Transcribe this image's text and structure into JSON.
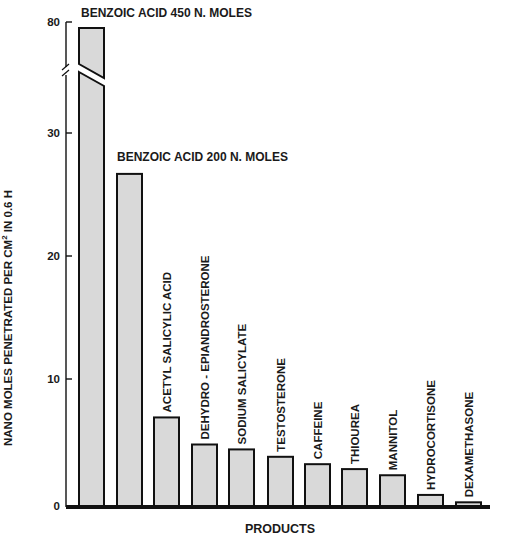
{
  "page_header": {
    "left": "",
    "right": ""
  },
  "chart_data": {
    "type": "bar",
    "title": "",
    "xlabel": "PRODUCTS",
    "ylabel": "NANO MOLES PENETRATED PER CM² IN 0.6 H",
    "ylabel_parts": {
      "before": "NANO MOLES PENETRATED PER CM",
      "sup": "2",
      "after": " IN 0.6 H"
    },
    "y_ticks": [
      0,
      10,
      20,
      30,
      80
    ],
    "y_break": {
      "from": 35,
      "to": 75
    },
    "ylim": [
      0,
      80
    ],
    "grid": false,
    "legend": null,
    "categories": [
      "BENZOIC ACID 450 N. MOLES",
      "BENZOIC ACID 200 N. MOLES",
      "ACETYL SALICYLIC ACID",
      "DEHYDRO - EPIANDROSTERONE",
      "SODIUM SALICYLATE",
      "TESTOSTERONE",
      "CAFFEINE",
      "THIOUREA",
      "MANNITOL",
      "HYDROCORTISONE",
      "DEXAMETHASONE"
    ],
    "values": [
      80,
      27,
      7.2,
      5.0,
      4.6,
      4.0,
      3.4,
      3.0,
      2.5,
      0.9,
      0.3
    ],
    "label_orientation": [
      "horizontal",
      "horizontal",
      "vertical",
      "vertical",
      "vertical",
      "vertical",
      "vertical",
      "vertical",
      "vertical",
      "vertical",
      "vertical"
    ],
    "colors": {
      "bar_fill": "#d9d9d9",
      "bar_stroke": "#111111",
      "axis": "#111111"
    }
  }
}
